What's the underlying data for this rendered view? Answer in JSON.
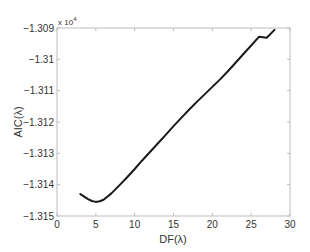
{
  "chart_data": {
    "type": "line",
    "title": "",
    "xlabel": "DF(λ)",
    "ylabel": "AIC(λ)",
    "y_multiplier_label": "x 10",
    "y_multiplier_exponent": "4",
    "xlim": [
      0,
      30
    ],
    "ylim": [
      -1.315,
      -1.309
    ],
    "xticks": [
      0,
      5,
      10,
      15,
      20,
      25,
      30
    ],
    "xtick_labels": [
      "0",
      "5",
      "10",
      "15",
      "20",
      "25",
      "30"
    ],
    "yticks": [
      -1.315,
      -1.314,
      -1.313,
      -1.312,
      -1.311,
      -1.31,
      -1.309
    ],
    "ytick_labels": [
      "-1.315",
      "-1.314",
      "-1.313",
      "-1.312",
      "-1.311",
      "-1.31",
      "-1.309"
    ],
    "grid": false,
    "legend": null,
    "series": [
      {
        "name": "AIC",
        "color": "#1a1a1a",
        "x": [
          3.0,
          3.5,
          4.0,
          4.5,
          5.0,
          5.5,
          6.0,
          7.0,
          8.0,
          9.0,
          10.0,
          11.0,
          12.0,
          13.0,
          14.0,
          15.0,
          16.0,
          17.0,
          18.0,
          19.0,
          20.0,
          21.0,
          22.0,
          23.0,
          24.0,
          25.0,
          26.0,
          27.0,
          28.0
        ],
        "y": [
          -1.3143,
          -1.31438,
          -1.31446,
          -1.31452,
          -1.31455,
          -1.31453,
          -1.31448,
          -1.31428,
          -1.31403,
          -1.31377,
          -1.3135,
          -1.31322,
          -1.31295,
          -1.31268,
          -1.31241,
          -1.31213,
          -1.31187,
          -1.31161,
          -1.31136,
          -1.31112,
          -1.31088,
          -1.31064,
          -1.31038,
          -1.31011,
          -1.30983,
          -1.30956,
          -1.30928,
          -1.309,
          -1.30906
        ]
      }
    ]
  }
}
